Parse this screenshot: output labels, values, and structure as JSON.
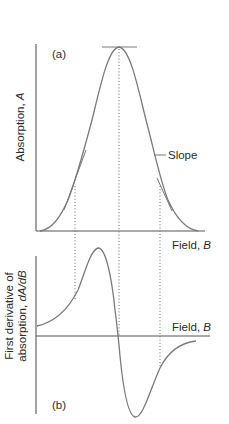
{
  "panel_a": {
    "label": "(a)",
    "y_axis_label": "Absorption, ",
    "y_axis_symbol": "A",
    "x_axis_label": "Field, ",
    "x_axis_symbol": "B",
    "annotation": "Slope"
  },
  "panel_b": {
    "label": "(b)",
    "y_axis_label_line1": "First derivative of",
    "y_axis_label_line2": "absorption, ",
    "y_axis_symbol": "dA/dB",
    "x_axis_label": "Field, ",
    "x_axis_symbol": "B"
  },
  "colors": {
    "curve": "#7a7a7a",
    "axis": "#555555",
    "text": "#2a2a2a"
  }
}
